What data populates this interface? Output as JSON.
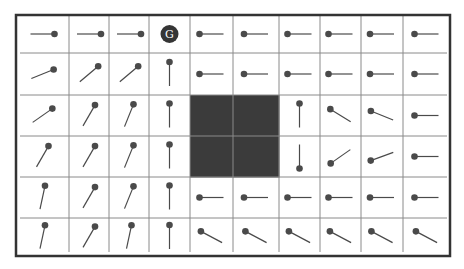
{
  "diagram": {
    "type": "gridworld-policy",
    "rows": 6,
    "cols": 10,
    "colors": {
      "background": "#ffffff",
      "grid_line": "#8a8a8a",
      "border": "#333333",
      "wall": "#3b3b3b",
      "pin": "#4a4a4a",
      "goal_fill": "#353535",
      "goal_text": "#ffffff"
    },
    "goal": {
      "row": 0,
      "col": 3,
      "label": "G"
    },
    "walls": [
      {
        "row": 2,
        "col": 4
      },
      {
        "row": 2,
        "col": 5
      },
      {
        "row": 3,
        "col": 4
      },
      {
        "row": 3,
        "col": 5
      }
    ],
    "policy_angles_deg": [
      [
        0,
        0,
        0,
        null,
        180,
        180,
        180,
        180,
        180,
        180
      ],
      [
        -22,
        -40,
        -40,
        -90,
        180,
        180,
        180,
        180,
        180,
        180
      ],
      [
        -35,
        -60,
        -68,
        -90,
        null,
        null,
        -90,
        -148,
        -158,
        180
      ],
      [
        -60,
        -60,
        -68,
        -90,
        null,
        null,
        90,
        145,
        160,
        180
      ],
      [
        -78,
        -60,
        -68,
        -90,
        180,
        180,
        180,
        180,
        180,
        180
      ],
      [
        -78,
        -60,
        -78,
        -90,
        -152,
        -152,
        -152,
        -152,
        -152,
        -152
      ]
    ],
    "legend_note": "Each pin points toward its dot (head); tail is the line."
  }
}
